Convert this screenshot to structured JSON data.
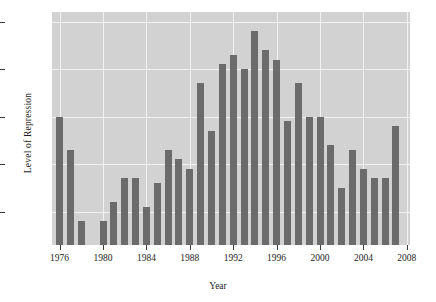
{
  "chart_data": {
    "type": "bar",
    "title": "",
    "xlabel": "Year",
    "ylabel": "Level of Repression",
    "ylim": [
      3.33,
      3.82
    ],
    "xlim": [
      1975.3,
      2008.3
    ],
    "grid": true,
    "legend": "none",
    "bar_color": "#6b6b6b",
    "panel_color": "#d2d2d2",
    "grid_color": "#f2f2f2",
    "ytick_labels": [
      "3.4",
      "3.5",
      "3.6",
      "3.7",
      "3.8"
    ],
    "ytick_values": [
      3.4,
      3.5,
      3.6,
      3.7,
      3.8
    ],
    "xtick_labels": [
      "1976",
      "1980",
      "1984",
      "1988",
      "1992",
      "1996",
      "2000",
      "2004",
      "2008"
    ],
    "xtick_values": [
      1976,
      1980,
      1984,
      1988,
      1992,
      1996,
      2000,
      2004,
      2008
    ],
    "categories": [
      1976,
      1977,
      1978,
      1979,
      1980,
      1981,
      1982,
      1983,
      1984,
      1985,
      1986,
      1987,
      1988,
      1989,
      1990,
      1991,
      1992,
      1993,
      1994,
      1995,
      1996,
      1997,
      1998,
      1999,
      2000,
      2001,
      2002,
      2003,
      2004,
      2005,
      2006,
      2007
    ],
    "values": [
      3.6,
      3.53,
      3.38,
      3.33,
      3.38,
      3.42,
      3.47,
      3.47,
      3.41,
      3.46,
      3.53,
      3.51,
      3.49,
      3.67,
      3.57,
      3.71,
      3.73,
      3.7,
      3.78,
      3.74,
      3.72,
      3.59,
      3.67,
      3.6,
      3.6,
      3.54,
      3.45,
      3.53,
      3.49,
      3.47,
      3.47,
      3.58
    ]
  }
}
